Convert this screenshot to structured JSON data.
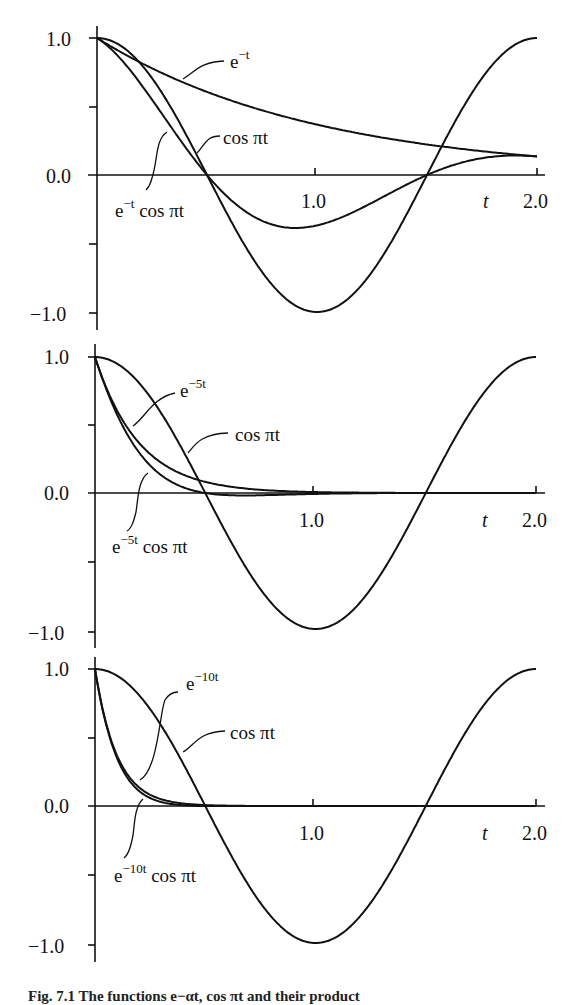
{
  "figure": {
    "caption": "Fig. 7.1 The functions e−αt, cos πt and their product",
    "x_axis_symbol": "t"
  },
  "chart_data": [
    {
      "type": "line",
      "panel": 1,
      "title": "",
      "xlabel": "t",
      "ylabel": "",
      "xlim": [
        0,
        2.0
      ],
      "ylim": [
        -1.0,
        1.0
      ],
      "x_tick_labels": [
        "1.0",
        "2.0"
      ],
      "y_tick_labels": [
        "1.0",
        "0.0",
        "−1.0"
      ],
      "grid": false,
      "series": [
        {
          "name": "e^-t",
          "label_base": "e",
          "label_sup": "−t",
          "label_rest": "",
          "expr": "exp(-t)",
          "decay": 1,
          "mode": "exp"
        },
        {
          "name": "cos πt",
          "label_base": "cos πt",
          "label_sup": "",
          "label_rest": "",
          "expr": "cos(pi t)",
          "decay": 0,
          "mode": "cos"
        },
        {
          "name": "e^-t cos πt",
          "label_base": "e",
          "label_sup": "−t",
          "label_rest": " cos πt",
          "expr": "exp(-t)cos(pi t)",
          "decay": 1,
          "mode": "prod"
        }
      ],
      "sample_points": {
        "t": [
          0,
          0.25,
          0.5,
          0.75,
          1.0,
          1.25,
          1.5,
          1.75,
          2.0
        ],
        "e^-t": [
          1.0,
          0.78,
          0.61,
          0.47,
          0.37,
          0.29,
          0.22,
          0.17,
          0.14
        ],
        "cos πt": [
          1.0,
          0.71,
          0.0,
          -0.71,
          -1.0,
          -0.71,
          0.0,
          0.71,
          1.0
        ],
        "e^-t cos πt": [
          1.0,
          0.55,
          0.0,
          -0.33,
          -0.37,
          -0.2,
          0.0,
          0.12,
          0.14
        ]
      }
    },
    {
      "type": "line",
      "panel": 2,
      "title": "",
      "xlabel": "t",
      "ylabel": "",
      "xlim": [
        0,
        2.0
      ],
      "ylim": [
        -1.0,
        1.0
      ],
      "x_tick_labels": [
        "1.0",
        "2.0"
      ],
      "y_tick_labels": [
        "1.0",
        "0.0",
        "−1.0"
      ],
      "grid": false,
      "series": [
        {
          "name": "e^-5t",
          "label_base": "e",
          "label_sup": "−5t",
          "label_rest": "",
          "expr": "exp(-5t)",
          "decay": 5,
          "mode": "exp"
        },
        {
          "name": "cos πt",
          "label_base": "cos πt",
          "label_sup": "",
          "label_rest": "",
          "expr": "cos(pi t)",
          "decay": 0,
          "mode": "cos"
        },
        {
          "name": "e^-5t cos πt",
          "label_base": "e",
          "label_sup": "−5t",
          "label_rest": " cos πt",
          "expr": "exp(-5t)cos(pi t)",
          "decay": 5,
          "mode": "prod"
        }
      ],
      "sample_points": {
        "t": [
          0,
          0.25,
          0.5,
          0.75,
          1.0,
          1.5,
          2.0
        ],
        "e^-5t": [
          1.0,
          0.29,
          0.08,
          0.02,
          0.01,
          0.0,
          0.0
        ],
        "cos πt": [
          1.0,
          0.71,
          0.0,
          -0.71,
          -1.0,
          0.0,
          1.0
        ],
        "e^-5t cos πt": [
          1.0,
          0.2,
          0.0,
          -0.02,
          -0.01,
          0.0,
          0.0
        ]
      }
    },
    {
      "type": "line",
      "panel": 3,
      "title": "",
      "xlabel": "t",
      "ylabel": "",
      "xlim": [
        0,
        2.0
      ],
      "ylim": [
        -1.0,
        1.0
      ],
      "x_tick_labels": [
        "1.0",
        "2.0"
      ],
      "y_tick_labels": [
        "1.0",
        "0.0",
        "−1.0"
      ],
      "grid": false,
      "series": [
        {
          "name": "e^-10t",
          "label_base": "e",
          "label_sup": "−10t",
          "label_rest": "",
          "expr": "exp(-10t)",
          "decay": 10,
          "mode": "exp"
        },
        {
          "name": "cos πt",
          "label_base": "cos πt",
          "label_sup": "",
          "label_rest": "",
          "expr": "cos(pi t)",
          "decay": 0,
          "mode": "cos"
        },
        {
          "name": "e^-10t cos πt",
          "label_base": "e",
          "label_sup": "−10t",
          "label_rest": " cos πt",
          "expr": "exp(-10t)cos(pi t)",
          "decay": 10,
          "mode": "prod"
        }
      ],
      "sample_points": {
        "t": [
          0,
          0.1,
          0.25,
          0.5,
          1.0,
          1.5,
          2.0
        ],
        "e^-10t": [
          1.0,
          0.37,
          0.08,
          0.01,
          0.0,
          0.0,
          0.0
        ],
        "cos πt": [
          1.0,
          0.95,
          0.71,
          0.0,
          -1.0,
          0.0,
          1.0
        ],
        "e^-10t cos πt": [
          1.0,
          0.35,
          0.06,
          0.0,
          0.0,
          0.0,
          0.0
        ]
      }
    }
  ]
}
